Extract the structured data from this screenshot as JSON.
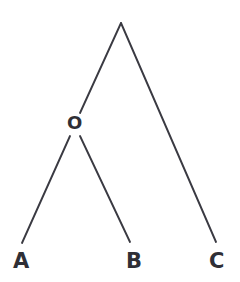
{
  "figure": {
    "type": "tree-diagram",
    "title": "",
    "background_color": "#ffffff",
    "branch_color": "#3a3a42",
    "label_color": "#2f2f36",
    "branch_width": 1.9
  },
  "nodes": {
    "root": {
      "id": "root",
      "label": "",
      "x": 121,
      "y": 23
    },
    "internal_o": {
      "id": "O",
      "label": "O",
      "x": 76,
      "y": 124,
      "label_x": 67,
      "label_y": 114
    },
    "tip_a": {
      "id": "A",
      "label": "A",
      "x": 22,
      "y": 243,
      "label_x": 13,
      "label_y": 251
    },
    "tip_b": {
      "id": "B",
      "label": "B",
      "x": 130,
      "y": 242,
      "label_x": 126,
      "label_y": 251
    },
    "tip_c": {
      "id": "C",
      "label": "C",
      "x": 216,
      "y": 242,
      "label_x": 209,
      "label_y": 251
    }
  },
  "edges": [
    {
      "name": "root-to-o",
      "from": "root",
      "to": "O",
      "x1": 121,
      "y1": 23,
      "x2": 80,
      "y2": 113
    },
    {
      "name": "root-to-c",
      "from": "root",
      "to": "C",
      "x1": 121,
      "y1": 23,
      "x2": 216,
      "y2": 242
    },
    {
      "name": "o-to-a",
      "from": "O",
      "to": "A",
      "x1": 70,
      "y1": 136,
      "x2": 22,
      "y2": 243
    },
    {
      "name": "o-to-b",
      "from": "O",
      "to": "B",
      "x1": 80,
      "y1": 136,
      "x2": 130,
      "y2": 242
    }
  ],
  "labels": {
    "internal": [
      "O"
    ],
    "tips": [
      "A",
      "B",
      "C"
    ]
  }
}
